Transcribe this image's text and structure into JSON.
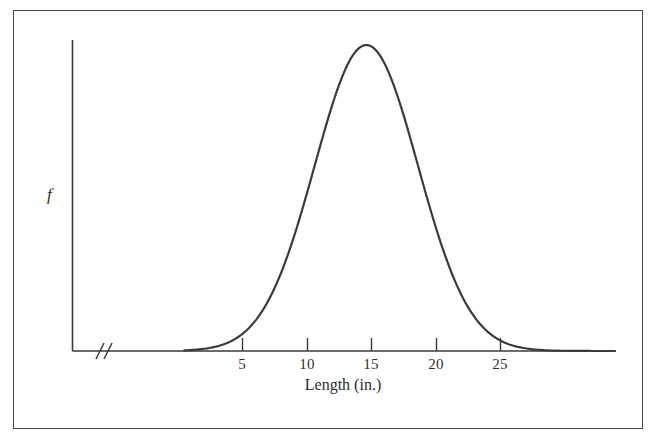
{
  "figure": {
    "kind": "normal-distribution-density-plot",
    "background_color": "#ffffff",
    "frame_color": "#4a4a4a",
    "axis_color": "#3a3a3a",
    "curve_color": "#3b3b3b"
  },
  "axes": {
    "y_label": "f",
    "x_label": "Length (in.)",
    "x_tick_labels": [
      "5",
      "10",
      "15",
      "20",
      "25"
    ],
    "axis_break_symbol": "//",
    "axis_break_present": true,
    "grid": "none",
    "legend": "none"
  },
  "chart_data": {
    "type": "line",
    "title": "",
    "subtitle": "",
    "xlabel": "Length (in.)",
    "ylabel": "f",
    "xlim": [
      0,
      32
    ],
    "ylim": [
      0,
      1.05
    ],
    "grid": false,
    "legend_position": "none",
    "x_ticks": [
      5,
      10,
      15,
      20,
      25
    ],
    "x_tick_labels": [
      "5",
      "10",
      "15",
      "20",
      "25"
    ],
    "y_ticks": [],
    "y_tick_labels": [],
    "annotations": [
      "axis break on x-axis near origin"
    ],
    "distribution": {
      "shape": "normal",
      "mean": 14.6,
      "std_dev": 4.0,
      "peak_x": 14.6,
      "peak_y": 1.0
    },
    "series": [
      {
        "name": "f",
        "x": [
          0,
          1,
          2,
          3,
          4,
          5,
          6,
          7,
          8,
          9,
          10,
          11,
          12,
          13,
          14,
          14.6,
          15,
          16,
          17,
          18,
          19,
          20,
          21,
          22,
          23,
          24,
          25,
          26,
          27,
          28,
          29,
          30,
          31,
          32
        ],
        "values": [
          0.001,
          0.002,
          0.005,
          0.011,
          0.022,
          0.041,
          0.071,
          0.115,
          0.175,
          0.25,
          0.339,
          0.438,
          0.539,
          0.685,
          0.935,
          1.0,
          0.988,
          0.92,
          0.822,
          0.705,
          0.58,
          0.46,
          0.35,
          0.255,
          0.178,
          0.119,
          0.076,
          0.046,
          0.027,
          0.015,
          0.008,
          0.004,
          0.002,
          0.001
        ]
      }
    ]
  }
}
